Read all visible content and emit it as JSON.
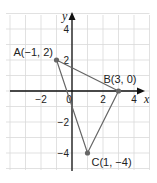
{
  "diagram": {
    "type": "coordinate-plane",
    "x_axis_label": "x",
    "y_axis_label": "y",
    "x_range": [
      -4,
      5
    ],
    "y_range": [
      -5,
      5
    ],
    "x_tick_labels": [
      {
        "value": -2,
        "label": "−2"
      },
      {
        "value": 0,
        "label": "0"
      },
      {
        "value": 2,
        "label": "2"
      },
      {
        "value": 4,
        "label": "4"
      }
    ],
    "y_tick_labels": [
      {
        "value": 4,
        "label": "4"
      },
      {
        "value": 2,
        "label": "2"
      },
      {
        "value": -2,
        "label": "−2"
      },
      {
        "value": -4,
        "label": "−4"
      }
    ],
    "points": [
      {
        "name": "A",
        "x": -1,
        "y": 2,
        "label": "A(−1, 2)"
      },
      {
        "name": "B",
        "x": 3,
        "y": 0,
        "label": "B(3, 0)"
      },
      {
        "name": "C",
        "x": 1,
        "y": -4,
        "label": "C(1, −4)"
      }
    ],
    "polygon": [
      "A",
      "B",
      "C"
    ],
    "colors": {
      "grid": "#d9d9d9",
      "axis": "#111111",
      "triangle": "#666666"
    }
  }
}
